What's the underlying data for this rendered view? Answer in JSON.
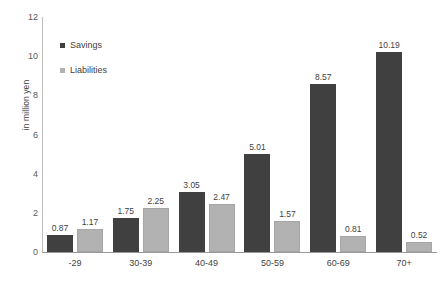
{
  "chart_data": {
    "type": "bar",
    "title": "",
    "xlabel": "",
    "ylabel": "in million yen",
    "categories": [
      "-29",
      "30-39",
      "40-49",
      "50-59",
      "60-69",
      "70+"
    ],
    "series": [
      {
        "name": "Savings",
        "color": "#404040",
        "values": [
          0.87,
          1.75,
          3.05,
          5.01,
          8.57,
          10.19
        ]
      },
      {
        "name": "Liabilities",
        "color": "#b2b2b2",
        "values": [
          1.17,
          2.25,
          2.47,
          1.57,
          0.81,
          0.52
        ]
      }
    ],
    "ylim": [
      0,
      12
    ],
    "yticks": [
      0,
      2,
      4,
      6,
      8,
      10,
      12
    ],
    "ytick_labels": [
      "0",
      "2",
      "4",
      "6",
      "8",
      "10",
      "12"
    ],
    "grid": false,
    "legend_position": "upper-left-inside",
    "data_labels": true
  }
}
